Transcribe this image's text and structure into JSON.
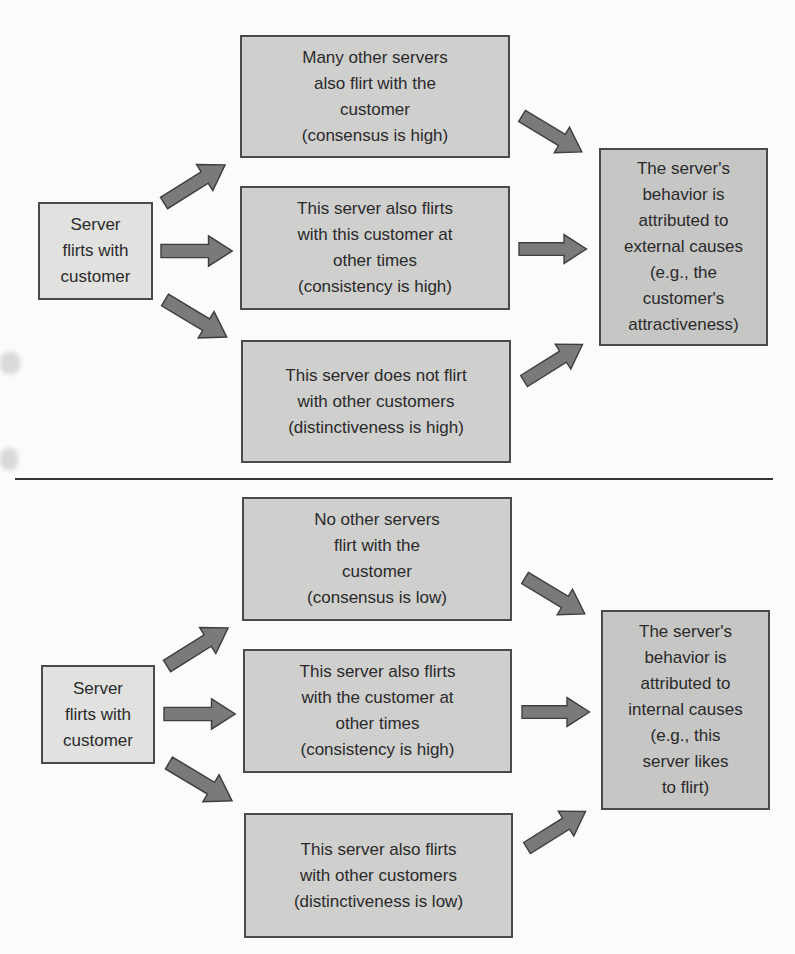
{
  "colors": {
    "source_box": "#e1e1e0",
    "mid_box": "#cfcfce",
    "result_box": "#c6c6c5",
    "arrow_fill": "#7a7a7a",
    "arrow_stroke": "#3e3e3e",
    "border": "#4a4a4a"
  },
  "panels": [
    {
      "source": "Server\nflirts with\ncustomer",
      "conditions": [
        "Many other servers\nalso flirt with the\ncustomer\n(consensus is high)",
        "This server also flirts\nwith this customer at\nother times\n(consistency is high)",
        "This server does not flirt\nwith other customers\n(distinctiveness is high)"
      ],
      "result": "The server's\nbehavior is\nattributed to\nexternal causes\n(e.g., the\ncustomer's\nattractiveness)"
    },
    {
      "source": "Server\nflirts with\ncustomer",
      "conditions": [
        "No other servers\nflirt with the\ncustomer\n(consensus is low)",
        "This server also flirts\nwith the customer at\nother times\n(consistency is high)",
        "This server also flirts\nwith other customers\n(distinctiveness is low)"
      ],
      "result": "The server's\nbehavior is\nattributed to\ninternal causes\n(e.g., this\nserver likes\nto flirt)"
    }
  ]
}
